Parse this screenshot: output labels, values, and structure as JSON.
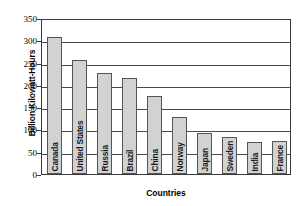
{
  "chart_data": {
    "type": "bar",
    "title": "",
    "subtitle": "",
    "xlabel": "Countries",
    "ylabel": "Billion Kilowatt-Hours",
    "categories": [
      "Canada",
      "United States",
      "Russia",
      "Brazil",
      "China",
      "Norway",
      "Japan",
      "Sweden",
      "India",
      "France"
    ],
    "values": [
      308,
      255,
      226,
      216,
      176,
      127,
      92,
      83,
      72,
      73
    ],
    "ylim": [
      0,
      350
    ],
    "ytick_values": [
      0,
      50,
      100,
      150,
      200,
      250,
      300,
      350
    ],
    "ytick_labels": [
      "0",
      "50",
      "100",
      "150",
      "200",
      "250",
      "300",
      "350"
    ],
    "grid": "horizontal",
    "legend": "none",
    "bar_fill_color": "#d2d2d2",
    "bar_border_color": "#555555",
    "axis_color": "#3a3a3a",
    "background_color": "#ffffff"
  },
  "axes": {
    "y_title": "Billion Kilowatt-Hours",
    "x_title": "Countries"
  }
}
